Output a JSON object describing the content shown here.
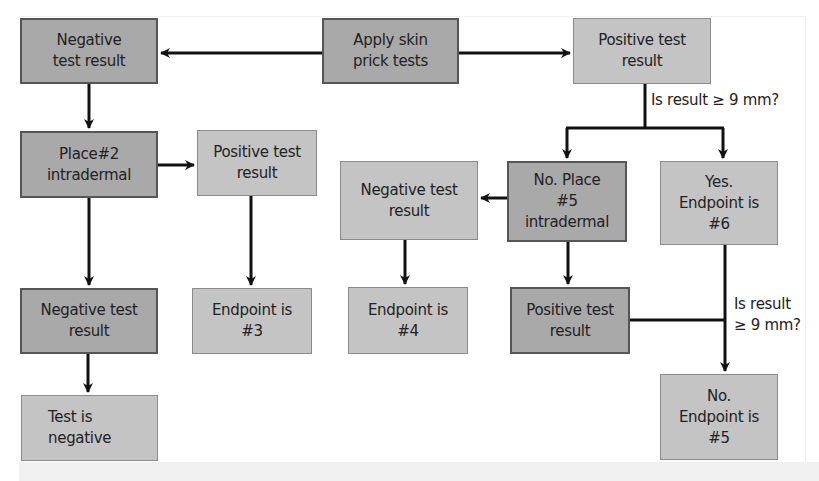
{
  "diagram": {
    "type": "flowchart",
    "colors": {
      "dark_box_fill": "#a9a9a9",
      "light_box_fill": "#c4c4c4",
      "arrow": "#111111"
    },
    "nodes": {
      "apply": "Apply skin\nprick tests",
      "neg1": "Negative\ntest result",
      "pos1": "Positive test\nresult",
      "place2": "Place#2\nintradermal",
      "pos2": "Positive test\nresult",
      "neg_mid": "Negative test\nresult",
      "place5": "No. Place\n#5\nintradermal",
      "endpoint6": "Yes.\nEndpoint is\n#6",
      "neg2": "Negative test\nresult",
      "endpoint3": "Endpoint is\n#3",
      "endpoint4": "Endpoint is\n#4",
      "pos3": "Positive test\nresult",
      "test_negative": "Test is\nnegative",
      "endpoint5": "No.\nEndpoint is\n#5"
    },
    "edge_labels": {
      "q1": "Is result ≥ 9 mm?",
      "q2": "Is result\n≥ 9 mm?"
    },
    "edges": [
      {
        "from": "apply",
        "to": "neg1"
      },
      {
        "from": "apply",
        "to": "pos1"
      },
      {
        "from": "neg1",
        "to": "place2"
      },
      {
        "from": "place2",
        "to": "pos2"
      },
      {
        "from": "place2",
        "to": "neg2"
      },
      {
        "from": "pos2",
        "to": "endpoint3"
      },
      {
        "from": "neg2",
        "to": "test_negative"
      },
      {
        "from": "pos1",
        "to": "place5",
        "label": "Is result ≥ 9 mm? (No)"
      },
      {
        "from": "pos1",
        "to": "endpoint6",
        "label": "Is result ≥ 9 mm? (Yes)"
      },
      {
        "from": "place5",
        "to": "neg_mid"
      },
      {
        "from": "place5",
        "to": "pos3"
      },
      {
        "from": "neg_mid",
        "to": "endpoint4"
      },
      {
        "from": "endpoint6",
        "to": "endpoint5"
      },
      {
        "from": "pos3",
        "to": "endpoint5",
        "label": "Is result ≥ 9 mm?"
      }
    ]
  }
}
